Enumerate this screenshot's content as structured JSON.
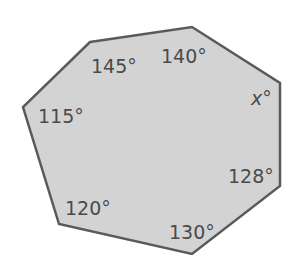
{
  "figure": {
    "shape": "heptagon",
    "fill_color": "#d3d3d3",
    "stroke_color": "#5a5a5a",
    "vertices": [
      [
        90,
        42
      ],
      [
        192,
        27
      ],
      [
        280,
        83
      ],
      [
        280,
        186
      ],
      [
        192,
        254
      ],
      [
        59,
        224
      ],
      [
        23,
        107
      ]
    ],
    "angles": [
      {
        "id": "top-left",
        "label": "145°",
        "x": 91,
        "y": 73
      },
      {
        "id": "top-right",
        "label": "140°",
        "x": 161,
        "y": 63
      },
      {
        "id": "right-upper",
        "variable": "x",
        "degree": "°",
        "x": 251,
        "y": 105
      },
      {
        "id": "left",
        "label": "115°",
        "x": 38,
        "y": 123
      },
      {
        "id": "right-lower",
        "label": "128°",
        "x": 228,
        "y": 183
      },
      {
        "id": "bottom-left",
        "label": "120°",
        "x": 65,
        "y": 215
      },
      {
        "id": "bottom",
        "label": "130°",
        "x": 169,
        "y": 239
      }
    ]
  }
}
